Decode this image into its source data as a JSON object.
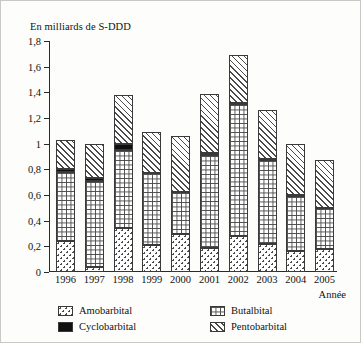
{
  "chart_data": {
    "type": "bar",
    "stacked": true,
    "title": "En milliards de S-DDD",
    "xlabel": "Année",
    "ylabel": "En milliards de S-DDD",
    "grid": false,
    "legend_position": "bottom",
    "ylim": [
      0,
      1.8
    ],
    "yticks": [
      "0",
      "0,2",
      "0,4",
      "0,6",
      "0,8",
      "1",
      "1,2",
      "1,4",
      "1,6",
      "1,8"
    ],
    "ytick_values": [
      0,
      0.2,
      0.4,
      0.6,
      0.8,
      1.0,
      1.2,
      1.4,
      1.6,
      1.8
    ],
    "categories": [
      "1996",
      "1997",
      "1998",
      "1999",
      "2000",
      "2001",
      "2002",
      "2003",
      "2004",
      "2005"
    ],
    "series": [
      {
        "name": "Amobarbital",
        "pattern": "dotted",
        "values": [
          0.24,
          0.04,
          0.34,
          0.21,
          0.3,
          0.19,
          0.28,
          0.22,
          0.16,
          0.18
        ]
      },
      {
        "name": "Butalbital",
        "pattern": "grid",
        "values": [
          0.54,
          0.67,
          0.61,
          0.56,
          0.32,
          0.72,
          1.03,
          0.65,
          0.43,
          0.32
        ]
      },
      {
        "name": "Cyclobarbital",
        "pattern": "solid-black",
        "values": [
          0.02,
          0.02,
          0.05,
          0.0,
          0.0,
          0.02,
          0.01,
          0.01,
          0.01,
          0.0
        ]
      },
      {
        "name": "Pentobarbital",
        "pattern": "diagonal-hatch",
        "values": [
          0.23,
          0.27,
          0.38,
          0.32,
          0.44,
          0.46,
          0.37,
          0.38,
          0.4,
          0.37
        ]
      }
    ],
    "totals": [
      1.03,
      1.0,
      1.38,
      1.09,
      1.06,
      1.39,
      1.69,
      1.26,
      1.0,
      0.87
    ]
  },
  "legend": {
    "items": [
      {
        "label": "Amobarbital"
      },
      {
        "label": "Cyclobarbital"
      },
      {
        "label": "Butalbital"
      },
      {
        "label": "Pentobarbital"
      }
    ]
  }
}
